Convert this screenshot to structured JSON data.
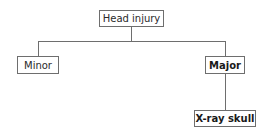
{
  "diagram": {
    "type": "decision-tree",
    "root": {
      "label": "Head injury"
    },
    "branches": [
      {
        "label": "Minor",
        "bold": false
      },
      {
        "label": "Major",
        "bold": true,
        "children": [
          {
            "label": "X-ray skull",
            "bold": true
          }
        ]
      }
    ],
    "colors": {
      "line": "#6e6e6e",
      "text": "#2a2a2a",
      "background": "#ffffff"
    }
  }
}
